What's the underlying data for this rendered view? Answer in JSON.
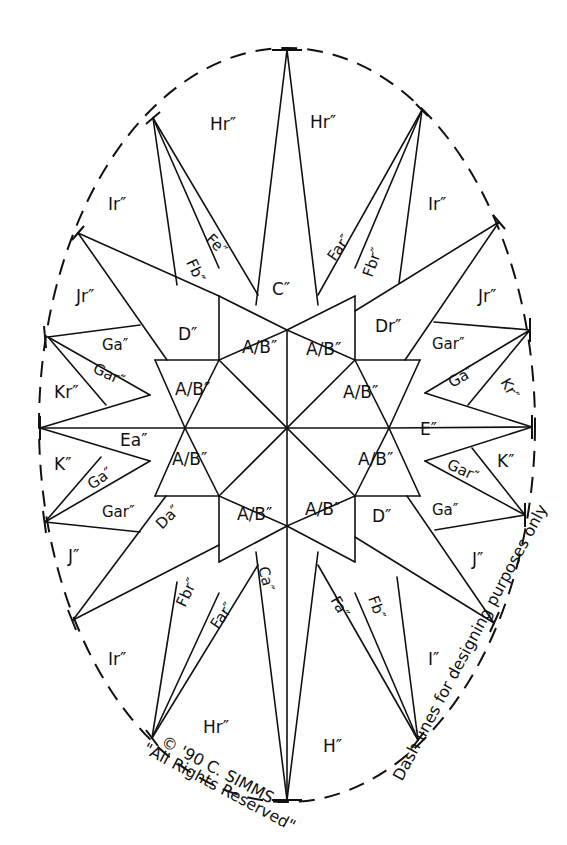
{
  "diagram": {
    "type": "quilt-pattern-compass-star",
    "colors": {
      "ink": "#111111",
      "background": "#ffffff"
    },
    "boundary": {
      "style": "dashed",
      "shape": "ellipse",
      "cx": 287,
      "cy": 425,
      "rx": 248,
      "ry": 377
    },
    "center": [
      287,
      428
    ],
    "labels": {
      "top_left_h": "Hr″",
      "top_right_h": "Hr″",
      "left_i": "Ir″",
      "right_i": "Ir″",
      "fe": "Fe″",
      "fb_left": "Fb″",
      "c_top": "C″",
      "far_top": "Far″",
      "fbr_top": "Fbr″",
      "jr_left": "Jr″",
      "jr_right": "Jr″",
      "d_top_left": "D″",
      "dr_top_right": "Dr″",
      "ab_1": "A/B″",
      "ab_2": "A/B″",
      "ab_3": "A/B″",
      "ab_4": "A/B″",
      "ab_5": "A/B″",
      "ab_6": "A/B″",
      "ab_7": "A/B″",
      "ab_8": "A/B″",
      "ga_left_top": "Ga″",
      "gar_left_top": "Gar″",
      "kr_left": "Kr″",
      "ea_left": "Ea″",
      "k_left": "K″",
      "ga_left_bottom": "Ga″",
      "gar_left_bottom": "Gar″",
      "da_bottom_left": "Da″",
      "j_left": "J″",
      "fbr_bottom": "Fbr″",
      "far_bottom": "Far″",
      "ca_bottom": "Ca″",
      "ir_bottom_left": "Ir″",
      "hr_bottom": "Hr″",
      "h_bottom": "H″",
      "gar_right_top": "Gar″",
      "ga_right_top": "Ga″",
      "kr_right": "Kr″",
      "e_right": "E″",
      "k_right": "K″",
      "gar_right_bottom": "Gar″",
      "ga_right_bottom": "Ga″",
      "d_bottom_right": "D″",
      "j_right": "J″",
      "fb_bottom": "Fb″",
      "fa_bottom": "Fa″",
      "i_bottom_right": "I″"
    },
    "annotations": {
      "copyright": "© '90 C. SIMMS",
      "rights": "\"All Rights Reserved\"",
      "dash_note": "Dash lines for designing purposes only"
    }
  }
}
